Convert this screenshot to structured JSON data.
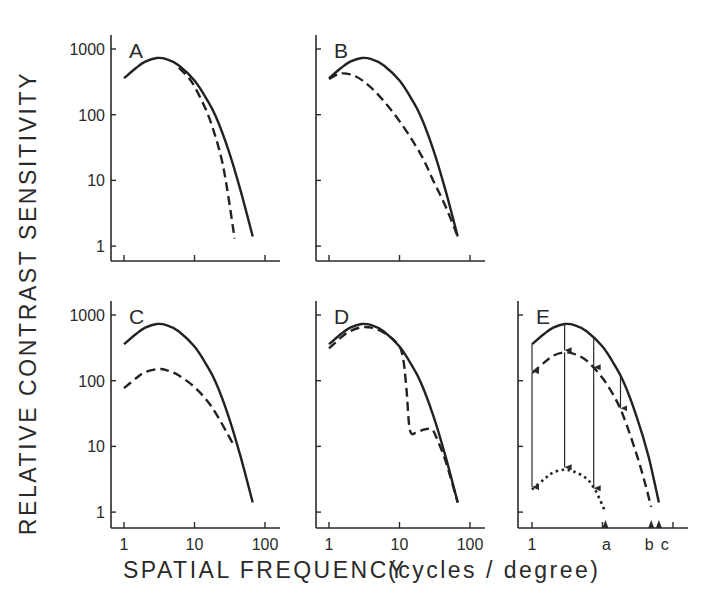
{
  "figure": {
    "ylabel": "RELATIVE CONTRAST SENSITIVITY",
    "xlabel": "SPATIAL FREQUENCY",
    "xunit": "(cycles / degree)"
  },
  "chart_data": [
    {
      "panel": "A",
      "type": "line",
      "xscale": "log",
      "yscale": "log",
      "xticks": [
        1,
        10,
        100
      ],
      "xtick_labels": [],
      "yticks": [
        1,
        10,
        100,
        1000
      ],
      "ytick_labels": [
        "1",
        "10",
        "100",
        "1000"
      ],
      "series": [
        {
          "name": "normal",
          "style": "solid",
          "x": [
            1,
            1.5,
            2,
            2.9,
            4,
            6,
            10,
            15,
            20,
            30,
            45,
            67
          ],
          "y": [
            360,
            520,
            640,
            730,
            700,
            560,
            330,
            170,
            95,
            30,
            7,
            1.4
          ]
        },
        {
          "name": "loss",
          "style": "dashed",
          "x": [
            6,
            8,
            10,
            15,
            20,
            25,
            30,
            37
          ],
          "y": [
            520,
            380,
            270,
            110,
            45,
            18,
            6,
            1.3
          ]
        }
      ]
    },
    {
      "panel": "B",
      "type": "line",
      "xscale": "log",
      "yscale": "log",
      "xticks": [
        1,
        10,
        100
      ],
      "xtick_labels": [],
      "yticks": [
        1,
        10,
        100,
        1000
      ],
      "ytick_labels": [],
      "series": [
        {
          "name": "normal",
          "style": "solid",
          "x": [
            1,
            1.5,
            2,
            2.9,
            4,
            6,
            10,
            15,
            20,
            30,
            45,
            67
          ],
          "y": [
            360,
            520,
            640,
            730,
            700,
            560,
            330,
            170,
            95,
            30,
            7,
            1.4
          ]
        },
        {
          "name": "loss",
          "style": "dashed",
          "x": [
            1,
            1.4,
            2,
            3,
            5,
            10,
            20,
            30,
            45,
            67
          ],
          "y": [
            350,
            420,
            410,
            330,
            200,
            80,
            25,
            10,
            4,
            1.4
          ]
        }
      ]
    },
    {
      "panel": "C",
      "type": "line",
      "xscale": "log",
      "yscale": "log",
      "xticks": [
        1,
        10,
        100
      ],
      "xtick_labels": [
        "1",
        "10",
        "100"
      ],
      "yticks": [
        1,
        10,
        100,
        1000
      ],
      "ytick_labels": [
        "1",
        "10",
        "100",
        "1000"
      ],
      "series": [
        {
          "name": "normal",
          "style": "solid",
          "x": [
            1,
            1.5,
            2,
            2.9,
            4,
            6,
            10,
            15,
            20,
            30,
            45,
            67
          ],
          "y": [
            360,
            520,
            640,
            730,
            700,
            560,
            330,
            170,
            95,
            30,
            7,
            1.4
          ]
        },
        {
          "name": "loss",
          "style": "dashed",
          "x": [
            1,
            1.5,
            2,
            3,
            4,
            6,
            10,
            15,
            20,
            30,
            35
          ],
          "y": [
            77,
            110,
            135,
            150,
            145,
            120,
            80,
            50,
            32,
            15,
            11
          ]
        }
      ]
    },
    {
      "panel": "D",
      "type": "line",
      "xscale": "log",
      "yscale": "log",
      "xticks": [
        1,
        10,
        100
      ],
      "xtick_labels": [
        "1",
        "10",
        "100"
      ],
      "yticks": [
        1,
        10,
        100,
        1000
      ],
      "ytick_labels": [],
      "series": [
        {
          "name": "normal",
          "style": "solid",
          "x": [
            1,
            1.5,
            2,
            2.9,
            4,
            6,
            10,
            15,
            20,
            30,
            45,
            67
          ],
          "y": [
            360,
            520,
            640,
            730,
            700,
            560,
            330,
            170,
            95,
            30,
            7,
            1.4
          ]
        },
        {
          "name": "loss",
          "style": "dashed",
          "x": [
            1,
            1.5,
            2,
            2.9,
            4,
            6,
            9,
            11,
            12.5,
            14,
            17,
            22,
            29,
            35,
            45,
            67
          ],
          "y": [
            310,
            460,
            570,
            650,
            640,
            540,
            380,
            250,
            80,
            18,
            16,
            18,
            18,
            12,
            6,
            1.4
          ]
        }
      ]
    },
    {
      "panel": "E",
      "type": "line",
      "xscale": "log",
      "yscale": "log",
      "xticks": [
        1,
        10,
        100
      ],
      "xtick_labels": [
        "1",
        "a",
        "b",
        "c"
      ],
      "yticks": [
        1,
        10,
        100,
        1000
      ],
      "ytick_labels": [],
      "markers": [
        {
          "label": "a",
          "x": 11
        },
        {
          "label": "b",
          "x": 49
        },
        {
          "label": "c",
          "x": 63
        }
      ],
      "series": [
        {
          "name": "normal",
          "style": "solid",
          "x": [
            1,
            1.5,
            2,
            2.9,
            4,
            6,
            10,
            15,
            20,
            30,
            45,
            63
          ],
          "y": [
            360,
            520,
            640,
            730,
            700,
            560,
            330,
            170,
            95,
            30,
            7,
            1.4
          ]
        },
        {
          "name": "reduced",
          "style": "dashed",
          "x": [
            1,
            1.5,
            2,
            2.9,
            4,
            6,
            10,
            15,
            20,
            30,
            40,
            49
          ],
          "y": [
            130,
            190,
            240,
            270,
            255,
            200,
            110,
            55,
            28,
            8,
            2.8,
            1.2
          ]
        },
        {
          "name": "further-reduced",
          "style": "dotted",
          "x": [
            1,
            1.5,
            2,
            2.9,
            4,
            6,
            8,
            11
          ],
          "y": [
            2.2,
            3.2,
            4,
            4.4,
            4.1,
            3.2,
            2.1,
            1.0
          ]
        }
      ],
      "arrows": [
        {
          "x": 1,
          "from": 360,
          "to": 140
        },
        {
          "x": 1,
          "from": 130,
          "to": 2.4
        },
        {
          "x": 2.9,
          "from": 730,
          "to": 290
        },
        {
          "x": 2.9,
          "from": 270,
          "to": 4.8
        },
        {
          "x": 7.5,
          "from": 470,
          "to": 160
        },
        {
          "x": 7.5,
          "from": 160,
          "to": 2.3
        },
        {
          "x": 18,
          "from": 120,
          "to": 38
        }
      ]
    }
  ]
}
